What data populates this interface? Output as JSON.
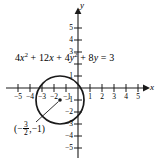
{
  "figure": {
    "type": "coordinate-plane-circle-graph",
    "background_color": "#ffffff",
    "ink_color": "#1a1a1a",
    "equation": {
      "full_text": "4x^2 + 12x + 4y^2 + 8y = 3",
      "parts": [
        {
          "text": "4",
          "kind": "number"
        },
        {
          "text": "x",
          "kind": "variable"
        },
        {
          "text": "2",
          "kind": "superscript"
        },
        {
          "text": " + 12",
          "kind": "number"
        },
        {
          "text": "x",
          "kind": "variable"
        },
        {
          "text": " + 4",
          "kind": "number"
        },
        {
          "text": "y",
          "kind": "variable"
        },
        {
          "text": "2",
          "kind": "superscript"
        },
        {
          "text": " + 8",
          "kind": "number"
        },
        {
          "text": "y",
          "kind": "variable"
        },
        {
          "text": " = 3",
          "kind": "number"
        }
      ]
    },
    "center_label": {
      "open_paren": "(",
      "minus": "−",
      "numerator": "3",
      "denominator": "2",
      "separator": ", ",
      "y_value": "−1",
      "close_paren": ")",
      "plain_text": "(−3/2, −1)"
    },
    "axes": {
      "x_axis_label": "x",
      "y_axis_label": "y",
      "x_ticks": [
        {
          "value": -5,
          "label": "−5"
        },
        {
          "value": -4,
          "label": "−4"
        },
        {
          "value": -3,
          "label": "−3"
        },
        {
          "value": -2,
          "label": "−2"
        },
        {
          "value": -1,
          "label": "−1"
        },
        {
          "value": 1,
          "label": "1"
        },
        {
          "value": 2,
          "label": "2"
        },
        {
          "value": 3,
          "label": "3"
        },
        {
          "value": 4,
          "label": "4"
        },
        {
          "value": 5,
          "label": "5"
        }
      ],
      "y_ticks": [
        {
          "value": 5,
          "label": "5"
        },
        {
          "value": 4,
          "label": "4"
        },
        {
          "value": 3,
          "label": "3"
        },
        {
          "value": 2,
          "label": ""
        },
        {
          "value": 1,
          "label": "1"
        },
        {
          "value": -1,
          "label": "−1"
        },
        {
          "value": -2,
          "label": "−2"
        },
        {
          "value": -3,
          "label": "−3"
        },
        {
          "value": -4,
          "label": "−4"
        },
        {
          "value": -5,
          "label": "−5"
        }
      ],
      "xlim": [
        -5.8,
        5.8
      ],
      "ylim": [
        -5.8,
        5.8
      ]
    },
    "circle": {
      "center_x": -1.5,
      "center_y": -1,
      "radius": 2,
      "stroke_width": 1.6,
      "center_dot_radius": 1.6
    },
    "leader_line": {
      "from_x": 34,
      "from_y": 120,
      "to_x": 58,
      "to_y": 90
    }
  }
}
